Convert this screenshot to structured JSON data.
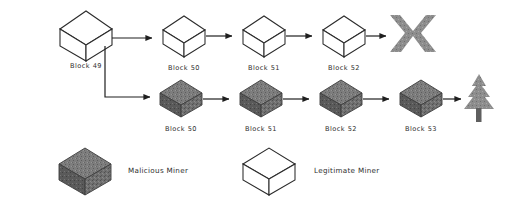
{
  "diagram": {
    "colors": {
      "malicious_fill": "#6e6e6e",
      "malicious_stroke": "#3a3a3a",
      "legitimate_fill": "#ffffff",
      "legitimate_stroke": "#2b2b2b",
      "arrow": "#1f1f1f",
      "reject_mark": "#8a8a8a",
      "accept_mark": "#8f8f8f",
      "background": "#ffffff",
      "text": "#2f2f2f"
    },
    "genesis": {
      "label": "Block 49",
      "type": "legitimate"
    },
    "branches": [
      {
        "name": "legitimate-chain",
        "type": "legitimate",
        "outcome": "rejected",
        "outcome_icon": "x-cross-icon",
        "blocks": [
          {
            "label": "Block 50"
          },
          {
            "label": "Block 51"
          },
          {
            "label": "Block 52"
          }
        ]
      },
      {
        "name": "malicious-chain",
        "type": "malicious",
        "outcome": "accepted",
        "outcome_icon": "tree-icon",
        "blocks": [
          {
            "label": "Block 50"
          },
          {
            "label": "Block 51"
          },
          {
            "label": "Block 52"
          },
          {
            "label": "Block 53"
          }
        ]
      }
    ],
    "legend": [
      {
        "icon": "malicious-cube-icon",
        "label": "Malicious Miner",
        "type": "malicious"
      },
      {
        "icon": "legitimate-cube-icon",
        "label": "Legitimate Miner",
        "type": "legitimate"
      }
    ]
  }
}
